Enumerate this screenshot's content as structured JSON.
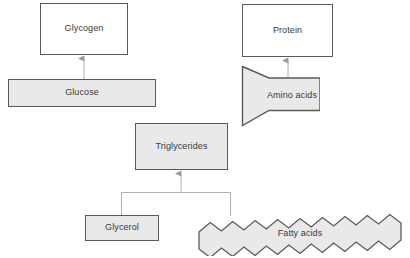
{
  "diagram": {
    "background_color": "#ffffff",
    "colors": {
      "shape_border": "#5a5a5a",
      "shape_fill_grey": "#e9e9e9",
      "shape_fill_white": "#ffffff",
      "connector_line": "#b0b0b0",
      "label_text": "#3a3a3a"
    },
    "nodes": [
      {
        "id": "glycogen",
        "label": "Glycogen",
        "shape": "rectangle",
        "fill": "white"
      },
      {
        "id": "glucose",
        "label": "Glucose",
        "shape": "rectangle",
        "fill": "grey"
      },
      {
        "id": "protein",
        "label": "Protein",
        "shape": "rectangle",
        "fill": "white"
      },
      {
        "id": "amino_acids",
        "label": "Amino acids",
        "shape": "pennant",
        "fill": "grey"
      },
      {
        "id": "triglycerides",
        "label": "Triglycerides",
        "shape": "rectangle",
        "fill": "grey"
      },
      {
        "id": "glycerol",
        "label": "Glycerol",
        "shape": "rectangle",
        "fill": "grey"
      },
      {
        "id": "fatty_acids",
        "label": "Fatty acids",
        "shape": "zigzag-band",
        "fill": "grey"
      }
    ],
    "connectors": [
      {
        "id": "glucose-to-glycogen",
        "from": "glucose",
        "to": "glycogen",
        "arrow": "up"
      },
      {
        "id": "amino-to-protein",
        "from": "amino_acids",
        "to": "protein",
        "arrow": "up"
      },
      {
        "id": "glycerol-fatty-to-trigly",
        "from": "glycerol + fatty_acids",
        "to": "triglycerides",
        "arrow": "up"
      }
    ]
  }
}
